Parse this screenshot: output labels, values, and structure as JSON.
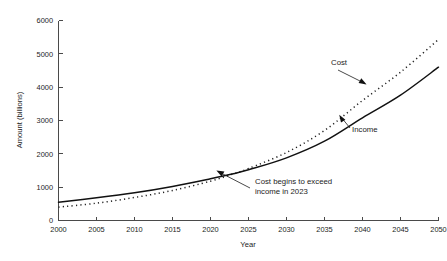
{
  "chart_data": {
    "type": "line",
    "title": "",
    "xlabel": "Year",
    "ylabel": "Amount (billions)",
    "xlim": [
      2000,
      2050
    ],
    "ylim": [
      0,
      6000
    ],
    "grid": false,
    "legend_position": "inline-annotations",
    "xticks": [
      "2000",
      "2005",
      "2010",
      "2015",
      "2020",
      "2025",
      "2030",
      "2035",
      "2040",
      "2045",
      "2050"
    ],
    "yticks": [
      "0",
      "1000",
      "2000",
      "3000",
      "4000",
      "5000",
      "6000"
    ],
    "x": [
      2000,
      2005,
      2010,
      2015,
      2020,
      2023,
      2025,
      2030,
      2035,
      2040,
      2045,
      2050
    ],
    "series": [
      {
        "name": "Income",
        "style": "solid",
        "color": "#111111",
        "values": [
          550,
          680,
          830,
          1020,
          1250,
          1400,
          1520,
          1880,
          2380,
          3080,
          3760,
          4600
        ]
      },
      {
        "name": "Cost",
        "style": "dotted",
        "color": "#222222",
        "values": [
          400,
          520,
          690,
          900,
          1180,
          1400,
          1560,
          2040,
          2700,
          3600,
          4450,
          5430
        ]
      }
    ],
    "annotations": [
      {
        "id": "crossover",
        "text_line1": "Cost begins to exceed",
        "text_line2": "income in 2023",
        "points_to_x": 2023,
        "points_to_y": 1400
      },
      {
        "id": "cost-label",
        "text": "Cost",
        "points_to_x": 2043,
        "points_to_y": 4080
      },
      {
        "id": "income-label",
        "text": "Income",
        "points_to_x": 2040,
        "points_to_y": 3080
      }
    ]
  }
}
